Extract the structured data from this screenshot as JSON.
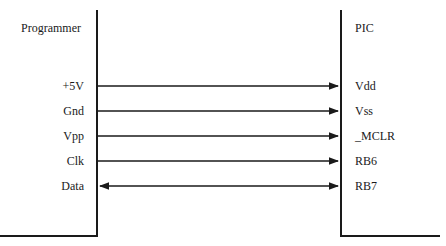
{
  "diagram": {
    "left_block": {
      "title": "Programmer"
    },
    "right_block": {
      "title": "PIC"
    },
    "connections": [
      {
        "from": "+5V",
        "to": "Vdd",
        "direction": "right"
      },
      {
        "from": "Gnd",
        "to": "Vss",
        "direction": "right"
      },
      {
        "from": "Vpp",
        "to": "_MCLR",
        "direction": "right"
      },
      {
        "from": "Clk",
        "to": "RB6",
        "direction": "right"
      },
      {
        "from": "Data",
        "to": "RB7",
        "direction": "both"
      }
    ],
    "line_color": "#1a1a1a"
  }
}
